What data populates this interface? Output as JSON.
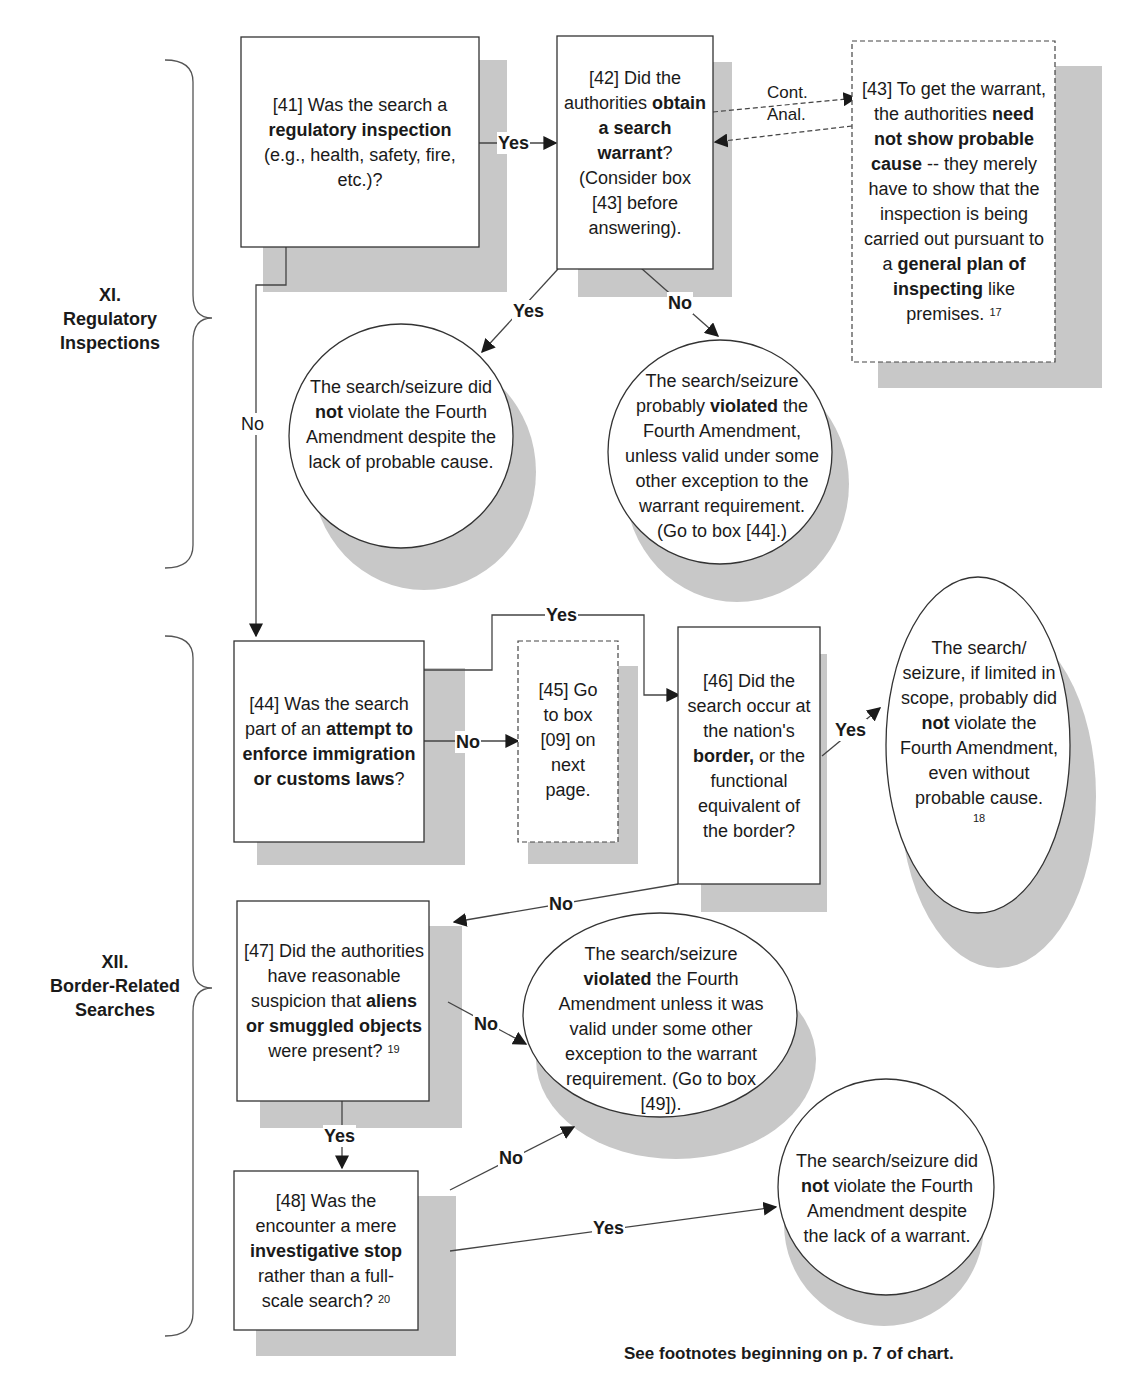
{
  "sections": [
    {
      "id": "XI",
      "title_line1": "XI.",
      "title_line2": "Regulatory",
      "title_line3": "Inspections"
    },
    {
      "id": "XII",
      "title_line1": "XII.",
      "title_line2": "Border-Related",
      "title_line3": "Searches"
    }
  ],
  "nodes": {
    "b41": {
      "shape": "rectangle",
      "parts": [
        {
          "text": "[41] Was the search a ",
          "bold": false
        },
        {
          "text": "regulatory inspection",
          "bold": true
        },
        {
          "text": " (e.g., health, safety, fire, etc.)?",
          "bold": false
        }
      ]
    },
    "b42": {
      "shape": "rectangle",
      "parts": [
        {
          "text": "[42] Did the authorities ",
          "bold": false
        },
        {
          "text": "obtain a search warrant",
          "bold": true
        },
        {
          "text": "? (Consider box [43] before answering).",
          "bold": false
        }
      ]
    },
    "b43": {
      "shape": "dashed-rectangle",
      "parts": [
        {
          "text": "[43] To get the warrant, the authorities ",
          "bold": false
        },
        {
          "text": "need not show probable cause",
          "bold": true
        },
        {
          "text": " -- they merely have to show that the inspection is being carried out pursuant to a ",
          "bold": false
        },
        {
          "text": "general plan of inspecting",
          "bold": true
        },
        {
          "text": " like premises.",
          "bold": false
        }
      ],
      "footnote": "17"
    },
    "c_not_violate_pc": {
      "shape": "circle",
      "parts": [
        {
          "text": "The search/seizure did ",
          "bold": false
        },
        {
          "text": "not",
          "bold": true
        },
        {
          "text": " violate the Fourth Amendment despite the lack of probable cause.",
          "bold": false
        }
      ]
    },
    "c_prob_violated": {
      "shape": "circle",
      "parts": [
        {
          "text": "The search/seizure probably ",
          "bold": false
        },
        {
          "text": "violated",
          "bold": true
        },
        {
          "text": " the Fourth Amendment, unless valid under some other exception to the warrant requirement. (Go to box [44].)",
          "bold": false
        }
      ]
    },
    "b44": {
      "shape": "rectangle",
      "parts": [
        {
          "text": "[44] Was the search part of an ",
          "bold": false
        },
        {
          "text": "attempt to enforce immigration or customs  laws",
          "bold": true
        },
        {
          "text": "?",
          "bold": false
        }
      ]
    },
    "b45": {
      "shape": "dashed-rectangle",
      "parts": [
        {
          "text": "[45] Go to box [09] on next page.",
          "bold": false
        }
      ]
    },
    "b46": {
      "shape": "rectangle",
      "parts": [
        {
          "text": "[46] Did the search occur at the nation's ",
          "bold": false
        },
        {
          "text": "border,",
          "bold": true
        },
        {
          "text": " or the functional equivalent of the border?",
          "bold": false
        }
      ]
    },
    "e_border_ok": {
      "shape": "ellipse",
      "parts": [
        {
          "text": "The search/ seizure, if limited in scope, probably did ",
          "bold": false
        },
        {
          "text": "not",
          "bold": true
        },
        {
          "text": " violate the Fourth Amendment, even without probable cause.",
          "bold": false
        }
      ],
      "footnote": "18"
    },
    "b47": {
      "shape": "rectangle",
      "parts": [
        {
          "text": "[47] Did the authorities have reasonable suspicion that ",
          "bold": false
        },
        {
          "text": "aliens or smuggled objects",
          "bold": true
        },
        {
          "text": " were present?",
          "bold": false
        }
      ],
      "footnote": "19"
    },
    "c_violated": {
      "shape": "circle",
      "parts": [
        {
          "text": "The search/seizure ",
          "bold": false
        },
        {
          "text": "violated",
          "bold": true
        },
        {
          "text": " the Fourth Amendment unless it was valid under some other exception to the warrant requirement. (Go to box [49]).",
          "bold": false
        }
      ]
    },
    "b48": {
      "shape": "rectangle",
      "parts": [
        {
          "text": "[48] Was the encounter a mere ",
          "bold": false
        },
        {
          "text": "investigative stop",
          "bold": true
        },
        {
          "text": " rather than a full-scale search?",
          "bold": false
        }
      ],
      "footnote": "20"
    },
    "c_not_violate_warrant": {
      "shape": "circle",
      "parts": [
        {
          "text": "The search/seizure did ",
          "bold": false
        },
        {
          "text": "not",
          "bold": true
        },
        {
          "text": " violate the Fourth Amendment despite the lack of a warrant.",
          "bold": false
        }
      ]
    }
  },
  "edges": {
    "e41_42": {
      "from": "b41",
      "to": "b42",
      "label": "Yes"
    },
    "e42_yes": {
      "from": "b42",
      "to": "c_not_violate_pc",
      "label": "Yes"
    },
    "e42_no": {
      "from": "b42",
      "to": "c_prob_violated",
      "label": "No"
    },
    "e42_43": {
      "from": "b42",
      "to": "b43",
      "label_line1": "Cont.",
      "label_line2": "Anal.",
      "style": "dashed"
    },
    "e41_44": {
      "from": "b41",
      "to": "b44",
      "label": "No"
    },
    "e44_45": {
      "from": "b44",
      "to": "b45",
      "label": "No"
    },
    "e44_46": {
      "from": "b44",
      "to": "b46",
      "label": "Yes"
    },
    "e46_yes": {
      "from": "b46",
      "to": "e_border_ok",
      "label": "Yes"
    },
    "e46_no": {
      "from": "b46",
      "to": "b47",
      "label": "No"
    },
    "e47_no": {
      "from": "b47",
      "to": "c_violated",
      "label": "No"
    },
    "e47_yes": {
      "from": "b47",
      "to": "b48",
      "label": "Yes"
    },
    "e48_no": {
      "from": "b48",
      "to": "c_violated",
      "label": "No"
    },
    "e48_yes": {
      "from": "b48",
      "to": "c_not_violate_warrant",
      "label": "Yes"
    }
  },
  "footer": {
    "note": "See footnotes beginning on p. 7 of chart."
  },
  "colors": {
    "shadow": "#c8c8c8",
    "stroke": "#333333",
    "text": "#1a1a1a"
  }
}
